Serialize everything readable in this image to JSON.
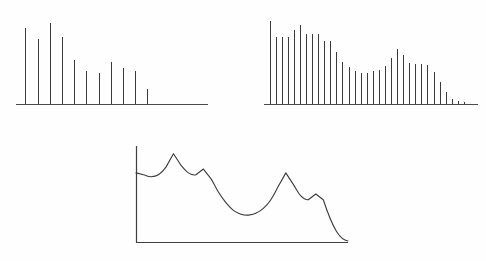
{
  "figure": {
    "background_color": "#fefefe",
    "ink_color": "#3b3b3b",
    "panel_count": 3,
    "panel_labels": [
      "sparse harmonic spectrum",
      "dense harmonic spectrum",
      "spectral envelope"
    ]
  },
  "chart_data": [
    {
      "type": "bar",
      "name": "sparse-harmonic-spectrum",
      "title": "",
      "subtitle": "",
      "xlabel": "",
      "ylabel": "",
      "grid": false,
      "legend": false,
      "axis_style": "baseline-only",
      "categories": [
        "1",
        "2",
        "3",
        "4",
        "5",
        "6",
        "7",
        "8",
        "9",
        "10",
        "11"
      ],
      "x": [
        1,
        2,
        3,
        4,
        5,
        6,
        7,
        8,
        9,
        10,
        11
      ],
      "values": [
        88,
        76,
        94,
        78,
        51,
        38,
        36,
        49,
        42,
        38,
        18
      ],
      "xlim": [
        0.4,
        13.5
      ],
      "ylim": [
        0,
        100
      ]
    },
    {
      "type": "bar",
      "name": "dense-harmonic-spectrum",
      "title": "",
      "subtitle": "",
      "xlabel": "",
      "ylabel": "",
      "grid": false,
      "legend": false,
      "axis_style": "baseline-only",
      "categories": [
        "1",
        "2",
        "3",
        "4",
        "5",
        "6",
        "7",
        "8",
        "9",
        "10",
        "11",
        "12",
        "13",
        "14",
        "15",
        "16",
        "17",
        "18",
        "19",
        "20",
        "21",
        "22",
        "23",
        "24",
        "25",
        "26",
        "27",
        "28",
        "29",
        "30",
        "31",
        "32",
        "33"
      ],
      "x": [
        1,
        2,
        3,
        4,
        5,
        6,
        7,
        8,
        9,
        10,
        11,
        12,
        13,
        14,
        15,
        16,
        17,
        18,
        19,
        20,
        21,
        22,
        23,
        24,
        25,
        26,
        27,
        28,
        29,
        30,
        31,
        32,
        33
      ],
      "values": [
        94,
        76,
        76,
        76,
        84,
        90,
        79,
        79,
        79,
        72,
        72,
        59,
        48,
        42,
        37,
        35,
        35,
        37,
        39,
        43,
        52,
        63,
        56,
        47,
        45,
        45,
        44,
        36,
        25,
        14,
        6,
        3,
        2
      ],
      "xlim": [
        0.4,
        35.0
      ],
      "ylim": [
        0,
        100
      ]
    },
    {
      "type": "line",
      "name": "spectral-envelope",
      "title": "",
      "subtitle": "",
      "xlabel": "",
      "ylabel": "",
      "grid": false,
      "legend": false,
      "axis_style": "left-and-bottom",
      "x": [
        0,
        4,
        8,
        12,
        16,
        20,
        24,
        28,
        32,
        36,
        40,
        44,
        48,
        52,
        56,
        60,
        64,
        68,
        72,
        76,
        80,
        84,
        88,
        92,
        96,
        100
      ],
      "values": [
        72,
        70,
        68,
        70,
        78,
        92,
        80,
        72,
        70,
        76,
        66,
        52,
        41,
        33,
        29,
        28,
        30,
        35,
        44,
        58,
        72,
        60,
        48,
        44,
        50,
        44
      ],
      "peaks": [
        {
          "x": 20,
          "y": 92,
          "label": "peak-1"
        },
        {
          "x": 36,
          "y": 76,
          "label": "peak-2"
        },
        {
          "x": 80,
          "y": 72,
          "label": "peak-3"
        },
        {
          "x": 96,
          "y": 50,
          "label": "peak-4"
        }
      ],
      "xlim": [
        0,
        110
      ],
      "ylim": [
        0,
        100
      ]
    }
  ]
}
